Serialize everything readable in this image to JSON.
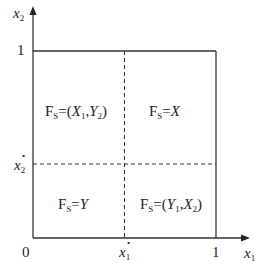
{
  "axes": {
    "x_label": "x",
    "x_sub": "1",
    "y_label": "x",
    "y_sub": "2",
    "origin": "0",
    "x_one": "1",
    "y_one": "1",
    "x_threshold": "x",
    "x_threshold_sub": "1",
    "y_threshold": "x",
    "y_threshold_sub": "2",
    "threshold_mark": "•"
  },
  "regions": {
    "top_left": {
      "prefix": "F",
      "prefix_sub": "S",
      "eq": "=(",
      "a": "X",
      "a_sub": "1",
      "comma": ",",
      "b": "Y",
      "b_sub": "2",
      "close": ")"
    },
    "top_right": {
      "prefix": "F",
      "prefix_sub": "S",
      "eq": "=",
      "val": "X"
    },
    "bottom_left": {
      "prefix": "F",
      "prefix_sub": "S",
      "eq": "=",
      "val": "Y"
    },
    "bottom_right": {
      "prefix": "F",
      "prefix_sub": "S",
      "eq": "=(",
      "a": "Y",
      "a_sub": "1",
      "comma": ",",
      "b": "X",
      "b_sub": "2",
      "close": ")"
    }
  },
  "colors": {
    "line": "#333333",
    "text": "#222222"
  }
}
